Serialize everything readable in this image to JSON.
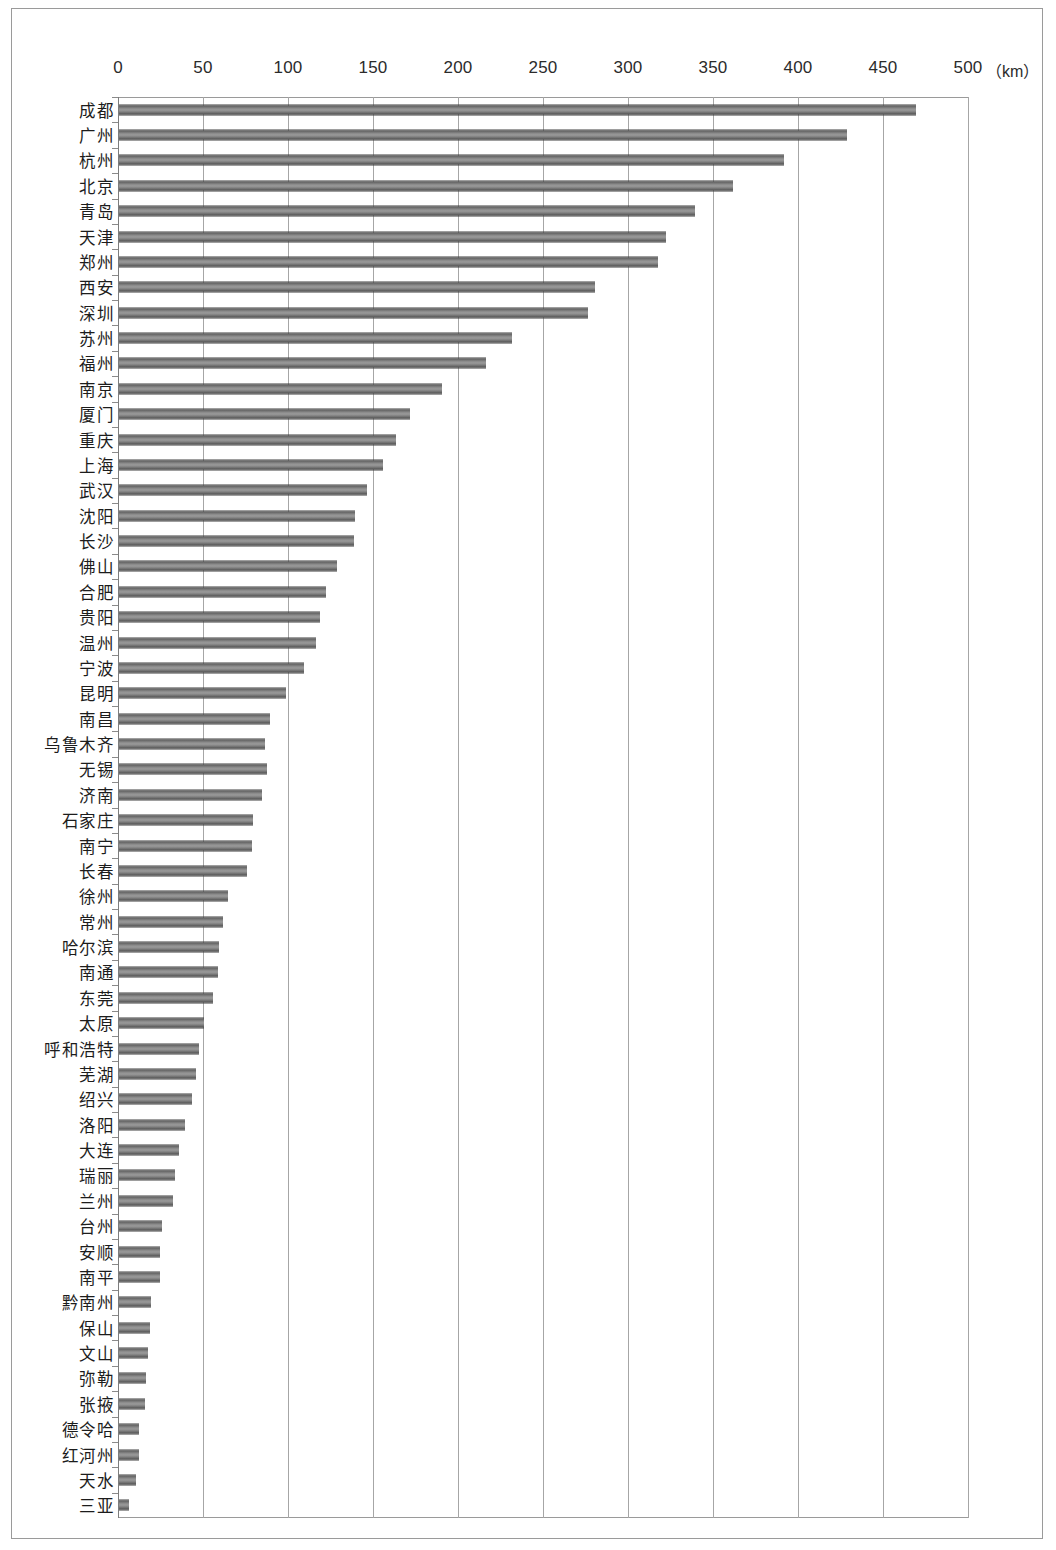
{
  "chart_data": {
    "type": "bar",
    "orientation": "horizontal",
    "title": "",
    "xlabel": "（km）",
    "ylabel": "",
    "xlim": [
      0,
      500
    ],
    "xticks": [
      0,
      50,
      100,
      150,
      200,
      250,
      300,
      350,
      400,
      450,
      500
    ],
    "grid": true,
    "legend": false,
    "unit": "（km）",
    "bar_color": "#8d8d8d",
    "categories": [
      "成都",
      "广州",
      "杭州",
      "北京",
      "青岛",
      "天津",
      "郑州",
      "西安",
      "深圳",
      "苏州",
      "福州",
      "南京",
      "厦门",
      "重庆",
      "上海",
      "武汉",
      "沈阳",
      "长沙",
      "佛山",
      "合肥",
      "贵阳",
      "温州",
      "宁波",
      "昆明",
      "南昌",
      "乌鲁木齐",
      "无锡",
      "济南",
      "石家庄",
      "南宁",
      "长春",
      "徐州",
      "常州",
      "哈尔滨",
      "南通",
      "东莞",
      "太原",
      "呼和浩特",
      "芜湖",
      "绍兴",
      "洛阳",
      "大连",
      "瑞丽",
      "兰州",
      "台州",
      "安顺",
      "南平",
      "黔南州",
      "保山",
      "文山",
      "弥勒",
      "张掖",
      "德令哈",
      "红河州",
      "天水",
      "三亚"
    ],
    "values": [
      469,
      428,
      391,
      361,
      339,
      322,
      317,
      280,
      276,
      231,
      216,
      190,
      171,
      163,
      155,
      146,
      139,
      138,
      128,
      122,
      118,
      116,
      109,
      98,
      89,
      86,
      87,
      84,
      79,
      78,
      75,
      64,
      61,
      59,
      58,
      55,
      50,
      47,
      45,
      43,
      39,
      35,
      33,
      32,
      25,
      24,
      24,
      19,
      18,
      17,
      16,
      15,
      12,
      12,
      10,
      6
    ]
  }
}
